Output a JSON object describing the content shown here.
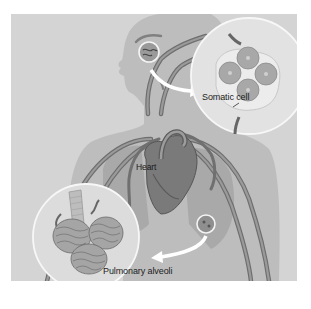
{
  "figure": {
    "type": "anatomical-illustration",
    "background_color": "#d4d4d4",
    "body_color": "#b9b9b9",
    "vessel_color": "#8a8a8a",
    "inset_color": "#e4e4e4",
    "arrow_color": "#ffffff"
  },
  "labels": {
    "somatic_cell": "Somatic cell",
    "heart": "Heart",
    "pulmonary_alveoli": "Pulmonary alveoli"
  },
  "insets": [
    {
      "name": "somatic-cell-inset",
      "label_ref": "labels.somatic_cell",
      "cells": 4
    },
    {
      "name": "pulmonary-alveoli-inset",
      "label_ref": "labels.pulmonary_alveoli",
      "alveoli_clusters": 3
    }
  ],
  "callouts": [
    {
      "name": "head-tissue-callout",
      "points_to": "somatic-cell-inset"
    },
    {
      "name": "lung-tissue-callout",
      "points_to": "pulmonary-alveoli-inset"
    }
  ]
}
